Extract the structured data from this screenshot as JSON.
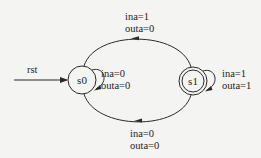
{
  "diagram": {
    "type": "finite-state-machine",
    "colors": {
      "background": "#f4f4f2",
      "stroke": "#2a2a2a",
      "text": "#1e1e1e"
    },
    "reset": {
      "label": "rst",
      "target": "s0"
    },
    "states": [
      {
        "id": "s0",
        "label": "s0",
        "accepting": false
      },
      {
        "id": "s1",
        "label": "s1",
        "accepting": true
      }
    ],
    "transitions": [
      {
        "from": "s0",
        "to": "s0",
        "input": "ina=0",
        "output": "outa=0"
      },
      {
        "from": "s0",
        "to": "s1",
        "input": "ina=1",
        "output": "outa=0"
      },
      {
        "from": "s1",
        "to": "s1",
        "input": "ina=1",
        "output": "outa=1"
      },
      {
        "from": "s1",
        "to": "s0",
        "input": "ina=0",
        "output": "outa=0"
      }
    ]
  }
}
